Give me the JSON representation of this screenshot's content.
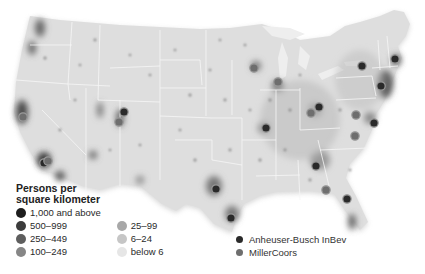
{
  "map": {
    "subject": "Population density of the contiguous United States with brewery locations",
    "colors": {
      "land": "#dedede",
      "background": "#ffffff",
      "state_borders": "#f4f4f4",
      "ab_inbev": "#2a2a2a",
      "millercoors": "#6e6e6e",
      "marker_ring": "#9a9a9a"
    }
  },
  "population_legend": {
    "title_line1": "Persons per",
    "title_line2": "square kilometer",
    "items": [
      {
        "label": "1,000 and above",
        "color": "#1e1e1e"
      },
      {
        "label": "500–999",
        "color": "#3c3c3c"
      },
      {
        "label": "250–449",
        "color": "#5e5e5e"
      },
      {
        "label": "100–249",
        "color": "#868686"
      },
      {
        "label": "25–99",
        "color": "#a8a8a8"
      },
      {
        "label": "6–24",
        "color": "#c6c6c6"
      },
      {
        "label": "below 6",
        "color": "#e6e6e6"
      }
    ]
  },
  "brewery_legend": {
    "items": [
      {
        "label": "Anheuser-Busch InBev",
        "color": "#2a2a2a"
      },
      {
        "label": "MillerCoors",
        "color": "#6e6e6e"
      }
    ]
  },
  "breweries": [
    {
      "company": "MillerCoors",
      "x": 23,
      "y": 117
    },
    {
      "company": "Anheuser-Busch InBev",
      "x": 44,
      "y": 163
    },
    {
      "company": "MillerCoors",
      "x": 48,
      "y": 161
    },
    {
      "company": "Anheuser-Busch InBev",
      "x": 124,
      "y": 112
    },
    {
      "company": "MillerCoors",
      "x": 119,
      "y": 122
    },
    {
      "company": "MillerCoors",
      "x": 254,
      "y": 68
    },
    {
      "company": "MillerCoors",
      "x": 278,
      "y": 82
    },
    {
      "company": "Anheuser-Busch InBev",
      "x": 266,
      "y": 128
    },
    {
      "company": "Anheuser-Busch InBev",
      "x": 319,
      "y": 107
    },
    {
      "company": "MillerCoors",
      "x": 311,
      "y": 113
    },
    {
      "company": "Anheuser-Busch InBev",
      "x": 362,
      "y": 66
    },
    {
      "company": "Anheuser-Busch InBev",
      "x": 395,
      "y": 59
    },
    {
      "company": "Anheuser-Busch InBev",
      "x": 381,
      "y": 86
    },
    {
      "company": "MillerCoors",
      "x": 356,
      "y": 115
    },
    {
      "company": "Anheuser-Busch InBev",
      "x": 374,
      "y": 123
    },
    {
      "company": "MillerCoors",
      "x": 355,
      "y": 136
    },
    {
      "company": "Anheuser-Busch InBev",
      "x": 216,
      "y": 189
    },
    {
      "company": "Anheuser-Busch InBev",
      "x": 231,
      "y": 218
    },
    {
      "company": "Anheuser-Busch InBev",
      "x": 316,
      "y": 166
    },
    {
      "company": "MillerCoors",
      "x": 326,
      "y": 190
    },
    {
      "company": "Anheuser-Busch InBev",
      "x": 347,
      "y": 199
    }
  ]
}
